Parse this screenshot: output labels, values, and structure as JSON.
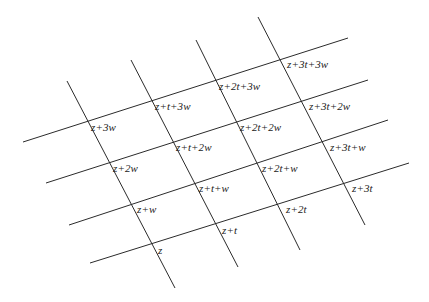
{
  "figure": {
    "kind": "lattice-diagram",
    "background_color": "#ffffff",
    "line_color": "#2b2b2b",
    "label_color": "#1c1c1c",
    "line_width": 1,
    "width": 429,
    "height": 302
  },
  "geometry": {
    "origin": {
      "x": 153,
      "y": 245
    },
    "vector_t": {
      "dx": 62,
      "dy": -21,
      "label": "t"
    },
    "vector_w": {
      "dx": -23,
      "dy": -41,
      "label": "w"
    },
    "t_index_range": [
      0,
      3
    ],
    "w_index_range": [
      0,
      3
    ],
    "line_extension_before": 0.42,
    "line_extension_after": 0.42
  },
  "lines": {
    "w_family": [
      {
        "name": "w-line-0",
        "x1": 90,
        "y1": 263,
        "x2": 409,
        "y2": 163
      },
      {
        "name": "w-line-1",
        "x1": 69,
        "y1": 225,
        "x2": 388,
        "y2": 120
      },
      {
        "name": "w-line-2",
        "x1": 46,
        "y1": 183,
        "x2": 368,
        "y2": 80
      },
      {
        "name": "w-line-3",
        "x1": 23,
        "y1": 142,
        "x2": 348,
        "y2": 38
      }
    ],
    "t_family": [
      {
        "name": "t-line-0",
        "x1": 67,
        "y1": 81,
        "x2": 175,
        "y2": 288
      },
      {
        "name": "t-line-1",
        "x1": 131,
        "y1": 60,
        "x2": 238,
        "y2": 267
      },
      {
        "name": "t-line-2",
        "x1": 196,
        "y1": 40,
        "x2": 300,
        "y2": 250
      },
      {
        "name": "t-line-3",
        "x1": 258,
        "y1": 17,
        "x2": 365,
        "y2": 225
      }
    ]
  },
  "nodes": [
    {
      "id": "n-0-0",
      "t": 0,
      "w": 0,
      "label": "z",
      "x": 158,
      "y": 250
    },
    {
      "id": "n-1-0",
      "t": 1,
      "w": 0,
      "label": "z+t",
      "x": 222,
      "y": 230
    },
    {
      "id": "n-2-0",
      "t": 2,
      "w": 0,
      "label": "z+2t",
      "x": 286,
      "y": 209
    },
    {
      "id": "n-3-0",
      "t": 3,
      "w": 0,
      "label": "z+3t",
      "x": 352,
      "y": 188
    },
    {
      "id": "n-0-1",
      "t": 0,
      "w": 1,
      "label": "z+w",
      "x": 137,
      "y": 209
    },
    {
      "id": "n-1-1",
      "t": 1,
      "w": 1,
      "label": "z+t+w",
      "x": 199,
      "y": 188
    },
    {
      "id": "n-2-1",
      "t": 2,
      "w": 1,
      "label": "z+2t+w",
      "x": 262,
      "y": 168
    },
    {
      "id": "n-3-1",
      "t": 3,
      "w": 1,
      "label": "z+3t+w",
      "x": 330,
      "y": 147
    },
    {
      "id": "n-0-2",
      "t": 0,
      "w": 2,
      "label": "z+2w",
      "x": 113,
      "y": 168
    },
    {
      "id": "n-1-2",
      "t": 1,
      "w": 2,
      "label": "z+t+2w",
      "x": 176,
      "y": 147
    },
    {
      "id": "n-2-2",
      "t": 2,
      "w": 2,
      "label": "z+2t+2w",
      "x": 240,
      "y": 127
    },
    {
      "id": "n-3-2",
      "t": 3,
      "w": 2,
      "label": "z+3t+2w",
      "x": 309,
      "y": 106
    },
    {
      "id": "n-0-3",
      "t": 0,
      "w": 3,
      "label": "z+3w",
      "x": 91,
      "y": 127
    },
    {
      "id": "n-1-3",
      "t": 1,
      "w": 3,
      "label": "z+t+3w",
      "x": 155,
      "y": 106
    },
    {
      "id": "n-2-3",
      "t": 2,
      "w": 3,
      "label": "z+2t+3w",
      "x": 219,
      "y": 86
    },
    {
      "id": "n-3-3",
      "t": 3,
      "w": 3,
      "label": "z+3t+3w",
      "x": 287,
      "y": 64
    }
  ]
}
